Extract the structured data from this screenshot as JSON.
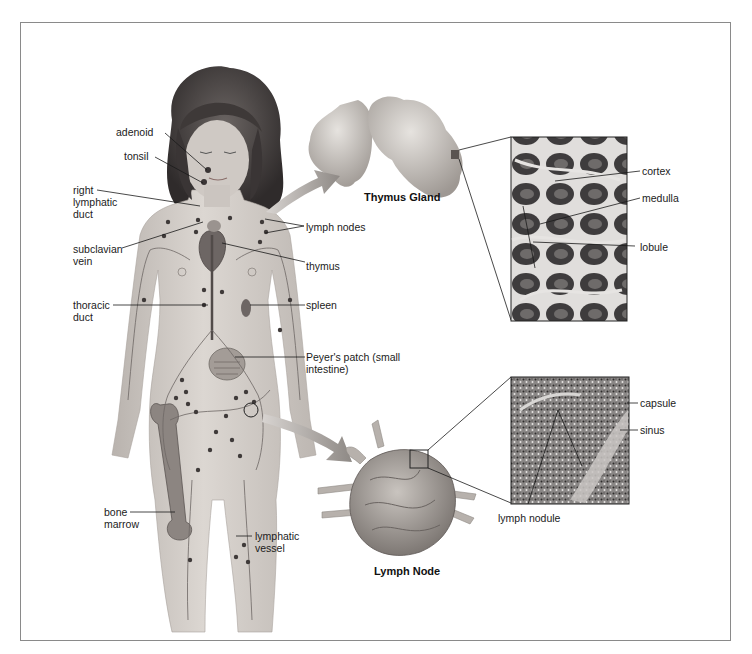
{
  "figure": {
    "type": "anatomical illustration"
  },
  "body_labels": {
    "adenoid": "adenoid",
    "tonsil": "tonsil",
    "right_lymphatic_duct": "right lymphatic duct",
    "subclavian_vein": "subclavian vein",
    "thoracic_duct": "thoracic duct",
    "bone_marrow": "bone marrow",
    "lymph_nodes": "lymph nodes",
    "thymus": "thymus",
    "spleen": "spleen",
    "peyers_patch": "Peyer's patch (small intestine)",
    "lymphatic_vessel": "lymphatic vessel"
  },
  "thymus_panel": {
    "title": "Thymus Gland",
    "micrograph_labels": {
      "cortex": "cortex",
      "medulla": "medulla",
      "lobule": "lobule"
    }
  },
  "lymph_node_panel": {
    "title": "Lymph Node",
    "micrograph_labels": {
      "capsule": "capsule",
      "sinus": "sinus",
      "lymph_nodule": "lymph nodule"
    }
  },
  "colors": {
    "frame": "#8a8a8a",
    "skin": "#d2ccc6",
    "hair": "#4a4544",
    "organ": "#b8b2ad",
    "node": "#3f3a39",
    "micrograph_dark": "#3c3a3b",
    "micrograph_light": "#d6d4d2",
    "leader_line": "#1a1a1a"
  }
}
